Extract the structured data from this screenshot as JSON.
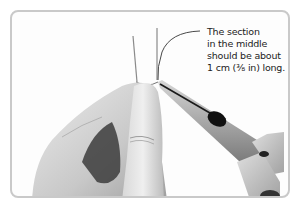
{
  "illustration": {
    "subject": "Hands holding wire with needle-nose pliers",
    "caption_lines": [
      "The section",
      "in the middle",
      "should be about",
      "1 cm (⅜ in) long."
    ],
    "colors": {
      "frame_border": "#c9c9c9",
      "background": "#fdfdfd",
      "caption_text": "#222222",
      "skin_light": "#e6e6e6",
      "skin_mid": "#bdbdbd",
      "skin_dark": "#5a5a5a",
      "plier_metal": "#a8a8a8",
      "plier_dark": "#1a1a1a",
      "wire": "#8a8a8a"
    }
  }
}
